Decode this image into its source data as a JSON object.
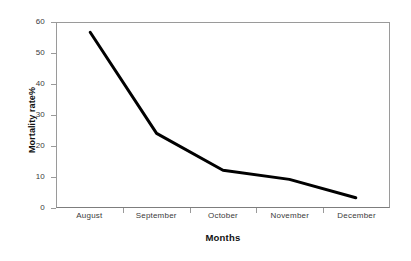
{
  "chart_data": {
    "type": "line",
    "title": "",
    "xlabel": "Months",
    "ylabel": "Mortality rate%",
    "categories": [
      "August",
      "September",
      "October",
      "November",
      "December"
    ],
    "values": [
      57,
      24,
      12,
      9,
      3
    ],
    "series": [
      {
        "name": "Mortality rate",
        "values": [
          57,
          24,
          12,
          9,
          3
        ],
        "color": "#000000",
        "line_width": 3,
        "markers": false
      }
    ],
    "ylim": [
      0,
      60
    ],
    "yticks": [
      0,
      10,
      20,
      30,
      40,
      50,
      60
    ],
    "ytick_labels": [
      "0",
      "10",
      "20",
      "30",
      "40",
      "50",
      "60"
    ],
    "xtick_labels": [
      "August",
      "September",
      "October",
      "November",
      "December"
    ],
    "grid": false,
    "legend": false,
    "legend_position": "none",
    "axis_color": "#9a9a9a",
    "background": "#ffffff",
    "frame": "box"
  }
}
